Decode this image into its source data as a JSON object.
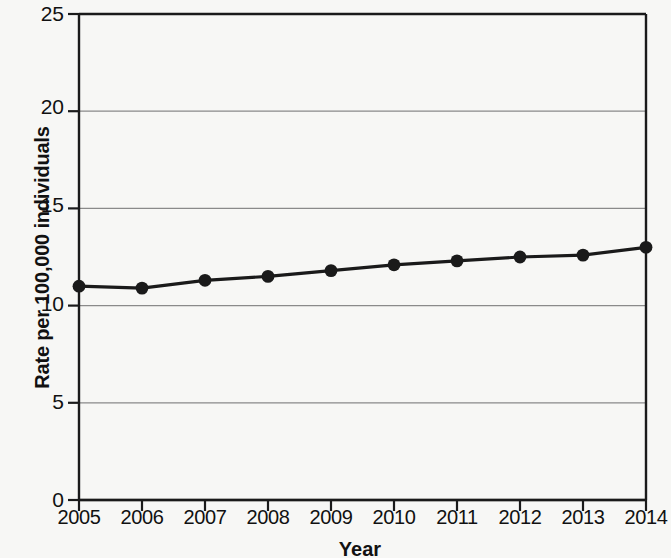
{
  "chart_data": {
    "type": "line",
    "title": "",
    "subtitle": "",
    "xlabel": "Year",
    "ylabel": "Rate per 100,000 individuals",
    "categories": [
      "2005",
      "2006",
      "2007",
      "2008",
      "2009",
      "2010",
      "2011",
      "2012",
      "2013",
      "2014"
    ],
    "x": [
      2005,
      2006,
      2007,
      2008,
      2009,
      2010,
      2011,
      2012,
      2013,
      2014
    ],
    "values": [
      11.0,
      10.9,
      11.3,
      11.5,
      11.8,
      12.1,
      12.3,
      12.5,
      12.6,
      13.0
    ],
    "series": [
      {
        "name": "Rate per 100,000 individuals",
        "values": [
          11.0,
          10.9,
          11.3,
          11.5,
          11.8,
          12.1,
          12.3,
          12.5,
          12.6,
          13.0
        ]
      }
    ],
    "ylim": [
      0,
      25
    ],
    "yticks": [
      0,
      5,
      10,
      15,
      20,
      25
    ],
    "ytick_labels": [
      "0",
      "5",
      "10",
      "15",
      "20",
      "25"
    ],
    "xtick_labels": [
      "2005",
      "2006",
      "2007",
      "2008",
      "2009",
      "2010",
      "2011",
      "2012",
      "2013",
      "2014"
    ],
    "grid": "horizontal",
    "legend": "none",
    "marker": "filled-circle",
    "line_color": "#1a1a1a",
    "marker_color": "#1a1a1a",
    "grid_color": "#8a8a8a",
    "axis_color": "#1a1a1a",
    "background_color": "#f7f7f5"
  }
}
